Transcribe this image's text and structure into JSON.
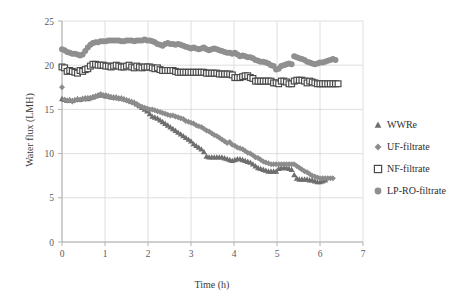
{
  "chart_data": {
    "type": "scatter",
    "title": "",
    "xlabel": "Time (h)",
    "ylabel": "Water flux (LMH)",
    "xlim": [
      0,
      7
    ],
    "ylim": [
      0,
      25
    ],
    "xticks": [
      0,
      1,
      2,
      3,
      4,
      5,
      6,
      7
    ],
    "yticks": [
      0,
      5,
      10,
      15,
      20,
      25
    ],
    "grid": true,
    "legend_position": "right",
    "colors": {
      "WWRe": "#6e6e6e",
      "UF-filtrate": "#8c8c8c",
      "NF-filtrate": "#4a4a4a",
      "LP-RO-filtrate": "#8f8f8f"
    },
    "markers": {
      "WWRe": "triangle",
      "UF-filtrate": "diamond",
      "NF-filtrate": "open-square",
      "LP-RO-filtrate": "circle"
    },
    "series": [
      {
        "name": "WWRe",
        "marker": "triangle",
        "color": "#6e6e6e",
        "x": [
          0.0,
          0.06,
          0.12,
          0.18,
          0.24,
          0.3,
          0.36,
          0.42,
          0.48,
          0.54,
          0.6,
          0.66,
          0.72,
          0.78,
          0.84,
          0.9,
          0.96,
          1.02,
          1.08,
          1.14,
          1.2,
          1.26,
          1.32,
          1.38,
          1.44,
          1.5,
          1.56,
          1.62,
          1.68,
          1.74,
          1.8,
          1.86,
          1.92,
          1.98,
          2.04,
          2.1,
          2.16,
          2.22,
          2.28,
          2.34,
          2.4,
          2.46,
          2.52,
          2.58,
          2.64,
          2.7,
          2.76,
          2.82,
          2.88,
          2.94,
          3.0,
          3.06,
          3.12,
          3.18,
          3.24,
          3.3,
          3.36,
          3.42,
          3.48,
          3.54,
          3.6,
          3.66,
          3.72,
          3.78,
          3.84,
          3.9,
          3.96,
          4.02,
          4.08,
          4.14,
          4.2,
          4.26,
          4.32,
          4.38,
          4.44,
          4.5,
          4.56,
          4.62,
          4.68,
          4.74,
          4.8,
          4.86,
          4.92,
          4.98,
          5.04,
          5.1,
          5.16,
          5.22,
          5.28,
          5.34,
          5.4,
          5.46,
          5.52,
          5.58,
          5.64,
          5.7,
          5.76,
          5.82,
          5.88,
          5.94,
          6.0,
          6.06,
          6.12
        ],
        "y": [
          16.2,
          16.1,
          16.0,
          16.1,
          16.0,
          16.1,
          16.2,
          16.1,
          16.2,
          16.3,
          16.2,
          16.3,
          16.4,
          16.5,
          16.6,
          16.7,
          16.6,
          16.5,
          16.5,
          16.4,
          16.4,
          16.4,
          16.3,
          16.3,
          16.2,
          16.1,
          16.0,
          15.9,
          15.8,
          15.6,
          15.4,
          15.2,
          15.0,
          14.8,
          14.5,
          14.2,
          14.1,
          14.0,
          13.8,
          13.6,
          13.4,
          13.2,
          13.0,
          12.8,
          12.6,
          12.4,
          12.2,
          12.0,
          11.8,
          11.6,
          11.4,
          11.1,
          10.9,
          10.7,
          10.5,
          10.2,
          9.7,
          9.6,
          9.6,
          9.6,
          9.6,
          9.6,
          9.6,
          9.5,
          9.4,
          9.3,
          9.2,
          9.3,
          9.4,
          9.4,
          9.3,
          9.2,
          9.1,
          9.0,
          8.8,
          8.6,
          8.4,
          8.3,
          8.2,
          8.1,
          8.0,
          8.0,
          8.0,
          8.0,
          8.3,
          8.4,
          8.4,
          8.4,
          8.3,
          8.2,
          7.6,
          7.2,
          7.1,
          7.1,
          7.1,
          7.1,
          7.0,
          7.0,
          6.9,
          6.8,
          6.8,
          6.9,
          7.0
        ]
      },
      {
        "name": "UF-filtrate",
        "marker": "diamond",
        "color": "#8c8c8c",
        "x": [
          0.0,
          0.06,
          0.12,
          0.18,
          0.24,
          0.3,
          0.36,
          0.42,
          0.48,
          0.54,
          0.6,
          0.66,
          0.72,
          0.78,
          0.84,
          0.9,
          0.96,
          1.02,
          1.08,
          1.14,
          1.2,
          1.26,
          1.32,
          1.38,
          1.44,
          1.5,
          1.56,
          1.62,
          1.68,
          1.74,
          1.8,
          1.86,
          1.92,
          1.98,
          2.04,
          2.1,
          2.16,
          2.22,
          2.28,
          2.34,
          2.4,
          2.46,
          2.52,
          2.58,
          2.64,
          2.7,
          2.76,
          2.82,
          2.88,
          2.94,
          3.0,
          3.06,
          3.12,
          3.18,
          3.24,
          3.3,
          3.36,
          3.42,
          3.48,
          3.54,
          3.6,
          3.66,
          3.72,
          3.78,
          3.84,
          3.9,
          3.96,
          4.02,
          4.08,
          4.14,
          4.2,
          4.26,
          4.32,
          4.38,
          4.44,
          4.5,
          4.56,
          4.62,
          4.68,
          4.74,
          4.8,
          4.86,
          4.92,
          4.98,
          5.04,
          5.1,
          5.16,
          5.22,
          5.28,
          5.34,
          5.4,
          5.46,
          5.52,
          5.58,
          5.64,
          5.7,
          5.76,
          5.82,
          5.88,
          5.94,
          6.0,
          6.06,
          6.12,
          6.18,
          6.24,
          6.3
        ],
        "y": [
          17.5,
          16.1,
          16.0,
          16.0,
          15.9,
          16.0,
          16.1,
          16.1,
          16.2,
          16.2,
          16.3,
          16.3,
          16.4,
          16.5,
          16.6,
          16.7,
          16.6,
          16.6,
          16.5,
          16.4,
          16.3,
          16.3,
          16.2,
          16.2,
          16.1,
          16.0,
          15.9,
          15.8,
          15.7,
          15.6,
          15.4,
          15.3,
          15.2,
          15.1,
          15.0,
          15.0,
          14.9,
          14.8,
          14.7,
          14.6,
          14.5,
          14.4,
          14.3,
          14.3,
          14.2,
          14.1,
          14.0,
          13.9,
          13.7,
          13.6,
          13.5,
          13.4,
          13.2,
          13.1,
          13.0,
          12.8,
          12.6,
          12.5,
          12.3,
          12.1,
          12.0,
          11.8,
          11.6,
          11.4,
          11.2,
          11.3,
          11.0,
          10.9,
          10.7,
          10.6,
          10.5,
          10.3,
          10.1,
          10.0,
          9.8,
          9.6,
          9.5,
          9.3,
          9.1,
          9.0,
          8.9,
          8.8,
          8.8,
          8.8,
          8.8,
          8.8,
          8.8,
          8.8,
          8.8,
          8.8,
          8.8,
          8.6,
          8.4,
          8.2,
          8.0,
          7.9,
          7.7,
          7.5,
          7.4,
          7.3,
          7.2,
          7.2,
          7.2,
          7.2,
          7.2,
          7.2
        ]
      },
      {
        "name": "NF-filtrate",
        "marker": "open-square",
        "color": "#4a4a4a",
        "x": [
          0.0,
          0.06,
          0.12,
          0.18,
          0.24,
          0.3,
          0.36,
          0.42,
          0.48,
          0.54,
          0.6,
          0.66,
          0.72,
          0.78,
          0.84,
          0.9,
          0.96,
          1.02,
          1.08,
          1.14,
          1.2,
          1.26,
          1.32,
          1.38,
          1.44,
          1.5,
          1.56,
          1.62,
          1.68,
          1.74,
          1.8,
          1.86,
          1.92,
          1.98,
          2.04,
          2.1,
          2.16,
          2.22,
          2.28,
          2.34,
          2.4,
          2.46,
          2.52,
          2.58,
          2.64,
          2.7,
          2.76,
          2.82,
          2.88,
          2.94,
          3.0,
          3.06,
          3.12,
          3.18,
          3.24,
          3.3,
          3.36,
          3.42,
          3.48,
          3.54,
          3.6,
          3.66,
          3.72,
          3.78,
          3.84,
          3.9,
          3.96,
          4.02,
          4.08,
          4.14,
          4.2,
          4.26,
          4.32,
          4.38,
          4.44,
          4.5,
          4.56,
          4.62,
          4.68,
          4.74,
          4.8,
          4.86,
          4.92,
          4.98,
          5.04,
          5.1,
          5.16,
          5.22,
          5.28,
          5.34,
          5.4,
          5.46,
          5.52,
          5.58,
          5.64,
          5.7,
          5.76,
          5.82,
          5.88,
          5.94,
          6.0,
          6.06,
          6.12,
          6.18,
          6.24,
          6.3,
          6.36,
          6.42
        ],
        "y": [
          19.8,
          19.7,
          19.3,
          19.4,
          19.3,
          19.2,
          19.1,
          19.4,
          19.3,
          19.5,
          19.6,
          19.9,
          20.1,
          20.1,
          20.0,
          20.0,
          20.0,
          19.9,
          19.9,
          19.8,
          19.9,
          20.0,
          19.9,
          19.8,
          19.8,
          19.9,
          20.0,
          19.8,
          19.7,
          19.9,
          19.8,
          19.7,
          19.8,
          19.8,
          19.8,
          19.7,
          19.6,
          19.7,
          19.5,
          19.4,
          19.4,
          19.4,
          19.4,
          19.4,
          19.3,
          19.2,
          19.2,
          19.2,
          19.2,
          19.2,
          19.2,
          19.2,
          19.2,
          19.2,
          19.2,
          19.2,
          19.1,
          19.1,
          19.1,
          19.1,
          19.1,
          19.0,
          19.0,
          19.0,
          19.0,
          19.0,
          18.9,
          18.6,
          18.6,
          18.6,
          18.7,
          18.8,
          18.8,
          18.6,
          18.5,
          18.2,
          18.2,
          18.2,
          18.2,
          18.2,
          18.2,
          18.2,
          18.0,
          18.0,
          17.9,
          18.2,
          18.2,
          18.1,
          17.9,
          17.9,
          18.2,
          18.3,
          18.3,
          18.3,
          18.2,
          18.0,
          18.2,
          18.1,
          18.0,
          17.9,
          17.9,
          17.9,
          17.9,
          17.9,
          17.9,
          17.9,
          17.9,
          17.9
        ]
      },
      {
        "name": "LP-RO-filtrate",
        "marker": "circle",
        "color": "#8f8f8f",
        "x": [
          0.0,
          0.06,
          0.12,
          0.18,
          0.24,
          0.3,
          0.36,
          0.42,
          0.48,
          0.54,
          0.6,
          0.66,
          0.72,
          0.78,
          0.84,
          0.9,
          0.96,
          1.02,
          1.08,
          1.14,
          1.2,
          1.26,
          1.32,
          1.38,
          1.44,
          1.5,
          1.56,
          1.62,
          1.68,
          1.74,
          1.8,
          1.86,
          1.92,
          1.98,
          2.04,
          2.1,
          2.16,
          2.22,
          2.28,
          2.34,
          2.4,
          2.46,
          2.52,
          2.58,
          2.64,
          2.7,
          2.76,
          2.82,
          2.88,
          2.94,
          3.0,
          3.06,
          3.12,
          3.18,
          3.24,
          3.3,
          3.36,
          3.42,
          3.48,
          3.54,
          3.6,
          3.66,
          3.72,
          3.78,
          3.84,
          3.9,
          3.96,
          4.02,
          4.08,
          4.14,
          4.2,
          4.26,
          4.32,
          4.38,
          4.44,
          4.5,
          4.56,
          4.62,
          4.68,
          4.74,
          4.8,
          4.86,
          4.92,
          4.98,
          5.04,
          5.1,
          5.16,
          5.22,
          5.28,
          5.34,
          5.4,
          5.46,
          5.52,
          5.58,
          5.64,
          5.7,
          5.76,
          5.82,
          5.88,
          5.94,
          6.0,
          6.06,
          6.12,
          6.18,
          6.24,
          6.3,
          6.36
        ],
        "y": [
          21.8,
          21.7,
          21.5,
          21.4,
          21.3,
          21.3,
          21.2,
          21.1,
          21.2,
          21.6,
          22.0,
          22.3,
          22.5,
          22.6,
          22.6,
          22.7,
          22.7,
          22.7,
          22.8,
          22.8,
          22.8,
          22.8,
          22.8,
          22.7,
          22.7,
          22.8,
          22.8,
          22.8,
          22.7,
          22.8,
          22.8,
          22.8,
          22.9,
          22.8,
          22.8,
          22.7,
          22.6,
          22.4,
          22.3,
          22.2,
          22.4,
          22.5,
          22.4,
          22.4,
          22.3,
          22.4,
          22.3,
          22.2,
          22.1,
          22.0,
          21.9,
          22.0,
          21.9,
          21.8,
          21.9,
          22.0,
          21.8,
          21.7,
          21.8,
          21.9,
          21.8,
          21.7,
          21.6,
          21.5,
          21.4,
          21.4,
          21.3,
          21.4,
          21.2,
          21.0,
          21.1,
          21.0,
          20.9,
          20.9,
          20.8,
          20.6,
          20.5,
          20.4,
          20.4,
          20.3,
          20.2,
          20.0,
          19.9,
          19.5,
          19.6,
          19.9,
          20.0,
          20.1,
          20.2,
          20.1,
          21.0,
          20.9,
          20.8,
          20.7,
          20.6,
          20.4,
          20.3,
          20.2,
          20.1,
          20.2,
          20.3,
          20.3,
          20.4,
          20.5,
          20.6,
          20.7,
          20.6
        ]
      }
    ]
  },
  "legend": {
    "items": [
      {
        "label": "WWRe",
        "marker": "triangle",
        "color": "#6e6e6e"
      },
      {
        "label": "UF-filtrate",
        "marker": "diamond",
        "color": "#8c8c8c"
      },
      {
        "label": "NF-filtrate",
        "marker": "open-square",
        "color": "#4a4a4a"
      },
      {
        "label": "LP-RO-filtrate",
        "marker": "circle",
        "color": "#8f8f8f"
      }
    ]
  }
}
